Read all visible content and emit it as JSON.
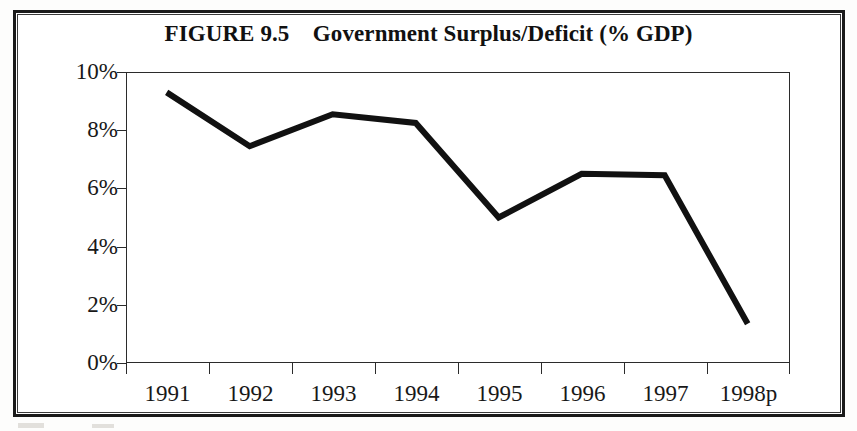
{
  "figure": {
    "title": "FIGURE 9.5    Government Surplus/Deficit (% GDP)",
    "figure_number": "FIGURE 9.5",
    "caption_text": "Government Surplus/Deficit (% GDP)"
  },
  "chart_data": {
    "type": "line",
    "title": "FIGURE 9.5    Government Surplus/Deficit (% GDP)",
    "xlabel": "",
    "ylabel": "",
    "categories": [
      "1991",
      "1992",
      "1993",
      "1994",
      "1995",
      "1996",
      "1997",
      "1998p"
    ],
    "values": [
      9.3,
      7.45,
      8.55,
      8.25,
      5.0,
      6.5,
      6.45,
      1.35
    ],
    "series": [
      {
        "name": "Government Surplus/Deficit (% GDP)",
        "values": [
          9.3,
          7.45,
          8.55,
          8.25,
          5.0,
          6.5,
          6.45,
          1.35
        ]
      }
    ],
    "ylim": [
      0,
      10
    ],
    "yticks": [
      0,
      2,
      4,
      6,
      8,
      10
    ],
    "ytick_labels": [
      "0%",
      "2%",
      "4%",
      "6%",
      "8%",
      "10%"
    ],
    "xtick_labels": [
      "1991",
      "1992",
      "1993",
      "1994",
      "1995",
      "1996",
      "1997",
      "1998p"
    ],
    "grid": false,
    "legend": false,
    "legend_position": "none",
    "line_color": "#111111",
    "line_width_px": 6,
    "frame_color": "#2b2b2b",
    "background_color": "#ffffff"
  }
}
